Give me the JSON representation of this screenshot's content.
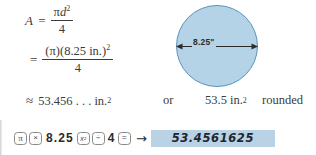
{
  "problem": {
    "equation_lines": [
      {
        "lhs": "A",
        "relation": "=",
        "numerator_pi": "π",
        "numerator_var": "d",
        "numerator_exp": "2",
        "denominator": "4"
      },
      {
        "relation": "=",
        "numerator": "(π)(8.25 in.)",
        "numerator_exp": "2",
        "denominator": "4"
      },
      {
        "relation": "≈",
        "value": "53.456 . . . in.",
        "value_exp": "2",
        "connector": "or",
        "rounded_value": "53.5 in.",
        "rounded_exp": "2",
        "rounded_note": "rounded"
      }
    ]
  },
  "figure": {
    "shape": "circle",
    "dimension_label": "8.25\"",
    "fill_color": "#b4d3e7",
    "stroke_color": "#5a93bd",
    "arrow_name": "diameter-double-arrow"
  },
  "calculator": {
    "keys": [
      {
        "type": "key",
        "label": "π",
        "name": "key-pi"
      },
      {
        "type": "key",
        "label": "×",
        "name": "key-multiply"
      },
      {
        "type": "digits",
        "label": "8.25",
        "name": "entry-8-25"
      },
      {
        "type": "key",
        "label": "x²",
        "name": "key-square"
      },
      {
        "type": "key",
        "label": "÷",
        "name": "key-divide"
      },
      {
        "type": "digits",
        "label": "4",
        "name": "entry-4"
      },
      {
        "type": "key",
        "label": "=",
        "name": "key-equals"
      }
    ],
    "arrow": "→",
    "display_value": "53.4561625",
    "display_bg": "#b9d2e6"
  }
}
